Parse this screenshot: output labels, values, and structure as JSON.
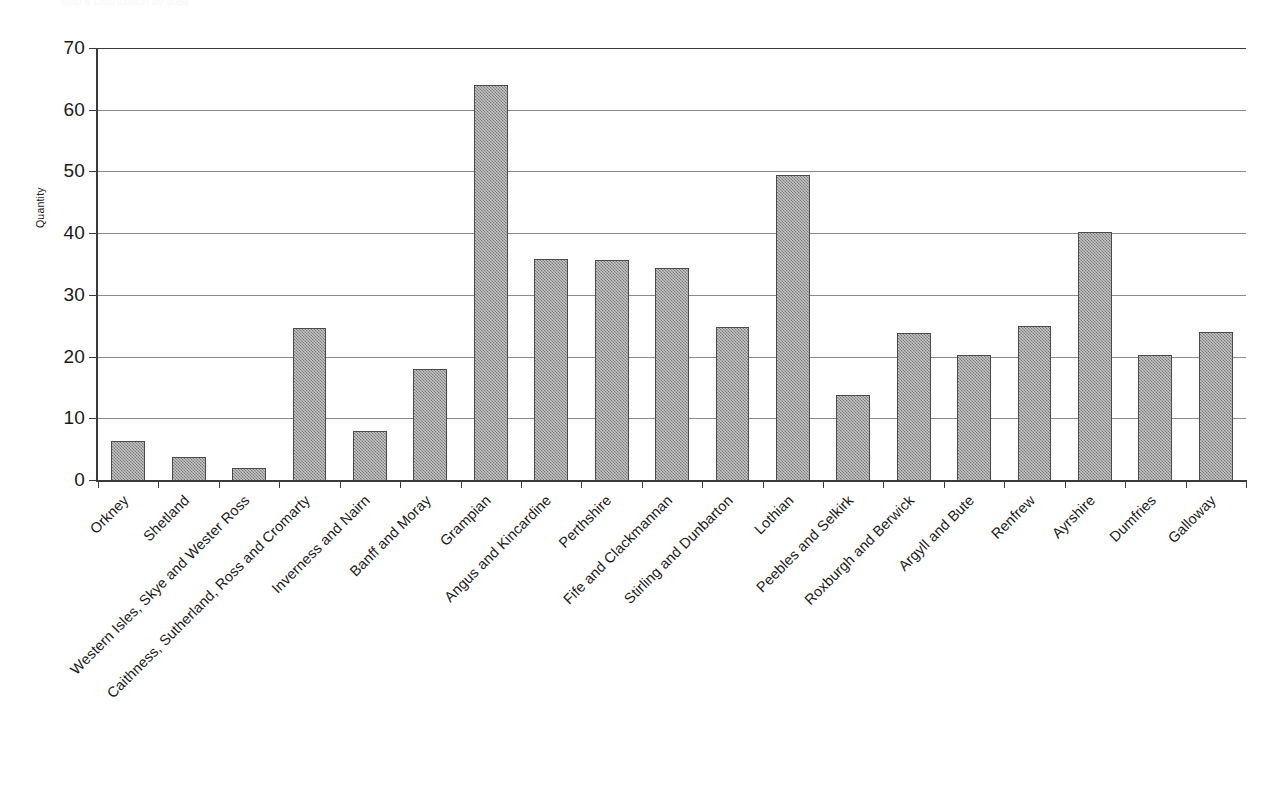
{
  "page": {
    "cut_off_title": "Map 6 Distribution by area"
  },
  "chart_data": {
    "type": "bar",
    "title": "",
    "subtitle": "",
    "xlabel": "",
    "ylabel": "Quantity",
    "ylim": [
      0,
      70
    ],
    "ytick_step": 10,
    "yticks": [
      70,
      60,
      50,
      40,
      30,
      20,
      10,
      0
    ],
    "grid": "horizontal",
    "legend": "none",
    "bar_color": "#999999",
    "bar_border_color": "#4a4a4a",
    "axis_color": "#3a3a3a",
    "gridline_color": "#8a8a8a",
    "categories": [
      "Orkney",
      "Shetland",
      "Western Isles, Skye and Wester Ross",
      "Caithness, Sutherland, Ross and Cromarty",
      "Inverness and Nairn",
      "Banff and Moray",
      "Grampian",
      "Angus and Kincardine",
      "Perthshire",
      "Fife and Clackmannan",
      "Stirling and Dunbarton",
      "Lothian",
      "Peebles and Selkirk",
      "Roxburgh and Berwick",
      "Argyll and Bute",
      "Renfrew",
      "Ayrshire",
      "Dumfries",
      "Galloway"
    ],
    "values": [
      6.3,
      3.7,
      1.9,
      24.6,
      8.0,
      18.0,
      64.0,
      35.8,
      35.7,
      34.4,
      24.8,
      49.5,
      13.8,
      23.8,
      20.3,
      25.0,
      40.2,
      20.3,
      24.0
    ]
  }
}
